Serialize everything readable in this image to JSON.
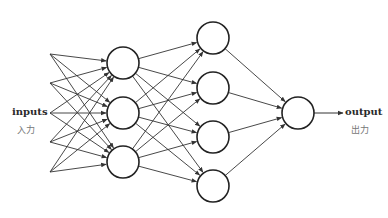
{
  "diagram": {
    "type": "feedforward-neural-network",
    "colors": {
      "line": "#333333",
      "node_fill": "#ffffff",
      "label": "#2a2a2a",
      "sub_label": "#777777"
    },
    "input_label": {
      "en": "inputs",
      "jp": "入力"
    },
    "output_label": {
      "en": "output",
      "jp": "出力"
    },
    "layers": [
      {
        "name": "input",
        "kind": "points",
        "x": 50,
        "ys": [
          54,
          83,
          113,
          142,
          172
        ]
      },
      {
        "name": "hidden-1",
        "kind": "nodes",
        "x": 123,
        "r": 16,
        "ys": [
          63,
          113,
          162
        ]
      },
      {
        "name": "hidden-2",
        "kind": "nodes",
        "x": 213,
        "r": 16,
        "ys": [
          38,
          88,
          137,
          186
        ]
      },
      {
        "name": "output",
        "kind": "nodes",
        "x": 298,
        "r": 16,
        "ys": [
          113
        ]
      }
    ],
    "output_arrow": {
      "x1": 314,
      "x2": 343,
      "y": 113
    },
    "layer_sizes": [
      5,
      3,
      4,
      1
    ]
  }
}
